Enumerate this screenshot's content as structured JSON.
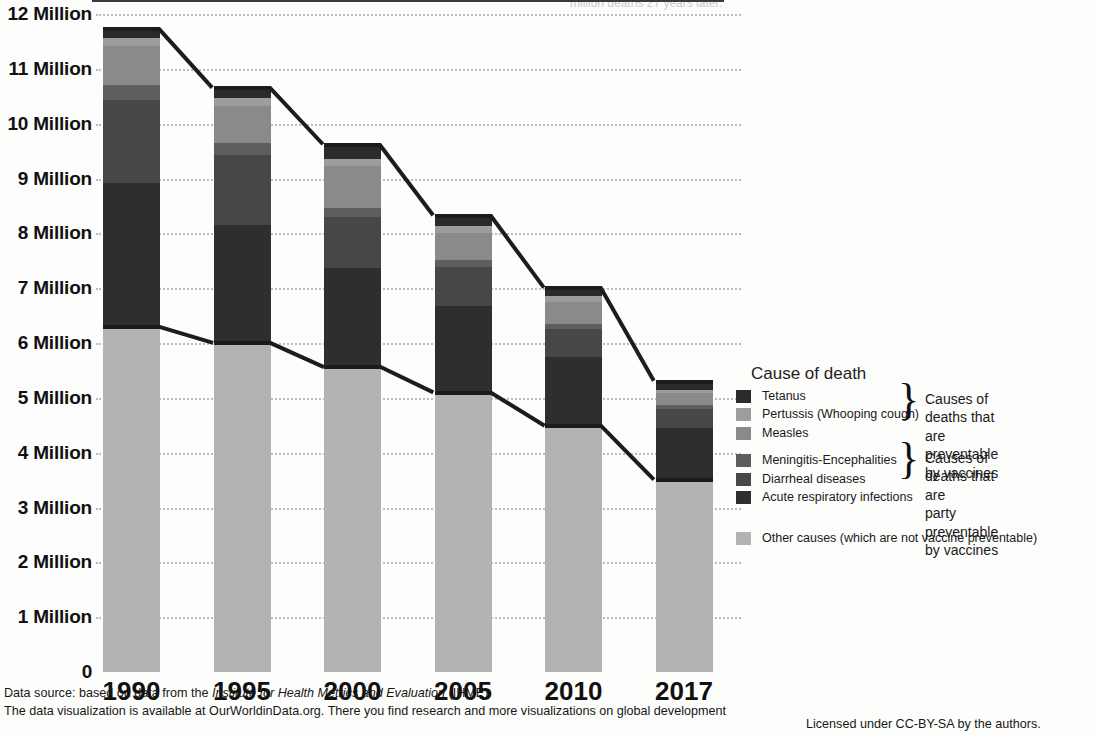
{
  "chart_data": {
    "type": "bar",
    "subtype": "stacked-bar-with-total-connectors",
    "title": "",
    "xlabel": "",
    "ylabel": "",
    "categories": [
      "1990",
      "1995",
      "2000",
      "2005",
      "2010",
      "2017"
    ],
    "ylim": [
      0,
      12
    ],
    "y_unit": "Million",
    "y_ticks": [
      0,
      1,
      2,
      3,
      4,
      5,
      6,
      7,
      8,
      9,
      10,
      11,
      12
    ],
    "y_tick_labels": [
      "0",
      "1 Million",
      "2 Million",
      "3 Million",
      "4 Million",
      "5 Million",
      "6 Million",
      "7 Million",
      "8 Million",
      "9 Million",
      "10 Million",
      "11 Million",
      "12 Million"
    ],
    "grid": true,
    "grid_style": "dotted-horizontal",
    "legend_position": "right",
    "stack_order_bottom_to_top": [
      "Other causes (which are not vaccine preventable)",
      "Acute respiratory infections",
      "Diarrheal diseases",
      "Meningitis-Encephalities",
      "Measles",
      "Pertussis (Whooping cough)",
      "Tetanus"
    ],
    "series": [
      {
        "name": "Other causes (which are not vaccine preventable)",
        "color": "#b3b3b3",
        "values": [
          6.29,
          6.0,
          5.56,
          5.09,
          4.49,
          3.5
        ]
      },
      {
        "name": "Acute respiratory infections",
        "color": "#2e2e2e",
        "values": [
          2.63,
          2.15,
          1.8,
          1.59,
          1.26,
          0.95
        ]
      },
      {
        "name": "Diarrheal diseases",
        "color": "#474747",
        "values": [
          1.52,
          1.27,
          0.93,
          0.7,
          0.5,
          0.35
        ]
      },
      {
        "name": "Meningitis-Encephalities",
        "color": "#5e5e5e",
        "values": [
          0.26,
          0.22,
          0.17,
          0.13,
          0.1,
          0.07
        ]
      },
      {
        "name": "Measles",
        "color": "#8a8a8a",
        "values": [
          0.71,
          0.68,
          0.77,
          0.5,
          0.4,
          0.21
        ]
      },
      {
        "name": "Pertussis (Whooping cough)",
        "color": "#9d9d9d",
        "values": [
          0.16,
          0.14,
          0.13,
          0.12,
          0.1,
          0.07
        ]
      },
      {
        "name": "Tetanus",
        "color": "#2b2b2b",
        "values": [
          0.16,
          0.19,
          0.25,
          0.19,
          0.15,
          0.14
        ]
      }
    ],
    "totals": [
      11.73,
      10.65,
      9.61,
      8.32,
      7.0,
      5.29
    ],
    "other_causes_top": [
      6.29,
      6.0,
      5.56,
      5.09,
      4.49,
      3.5
    ],
    "annotations": {
      "upper_connector": "line joining the top of each stacked bar (total child deaths)",
      "lower_connector": "line joining the top of the 'Other causes' segment of each bar"
    }
  },
  "axis": {
    "y_labels": [
      {
        "value": 12,
        "text": "12 Million"
      },
      {
        "value": 11,
        "text": "11 Million"
      },
      {
        "value": 10,
        "text": "10 Million"
      },
      {
        "value": 9,
        "text": "9 Million"
      },
      {
        "value": 8,
        "text": "8 Million"
      },
      {
        "value": 7,
        "text": "7 Million"
      },
      {
        "value": 6,
        "text": "6 Million"
      },
      {
        "value": 5,
        "text": "5 Million"
      },
      {
        "value": 4,
        "text": "4 Million"
      },
      {
        "value": 3,
        "text": "3 Million"
      },
      {
        "value": 2,
        "text": "2 Million"
      },
      {
        "value": 1,
        "text": "1 Million"
      },
      {
        "value": 0,
        "text": "0"
      }
    ],
    "x_labels": [
      "1990",
      "1995",
      "2000",
      "2005",
      "2010",
      "2017"
    ]
  },
  "legend": {
    "title": "Cause of death",
    "items": [
      {
        "label": "Tetanus",
        "color": "#2b2b2b"
      },
      {
        "label": "Pertussis (Whooping cough)",
        "color": "#9d9d9d"
      },
      {
        "label": "Measles",
        "color": "#8a8a8a"
      },
      {
        "label": "Meningitis-Encephalities",
        "color": "#5e5e5e"
      },
      {
        "label": "Diarrheal diseases",
        "color": "#474747"
      },
      {
        "label": "Acute respiratory infections",
        "color": "#2e2e2e"
      }
    ],
    "other": {
      "label": "Other causes (which are not vaccine preventable)",
      "color": "#b3b3b3"
    },
    "brace_notes": [
      "Causes of deaths that are\npreventable by vaccines",
      "Causes of deaths that are\nparty preventable by vaccines"
    ]
  },
  "footer": {
    "line1_prefix": "Data source: based on data from the ",
    "line1_italic": "Institute for Health Metrics and Evaluation",
    "line1_suffix": " (IHME)",
    "line2": "The data visualization is available at OurWorldinData.org. There you find research and more visualizations on global development",
    "license": "Licensed under CC-BY-SA by the authors."
  },
  "top_cropped_note": "million deaths 27 years later."
}
